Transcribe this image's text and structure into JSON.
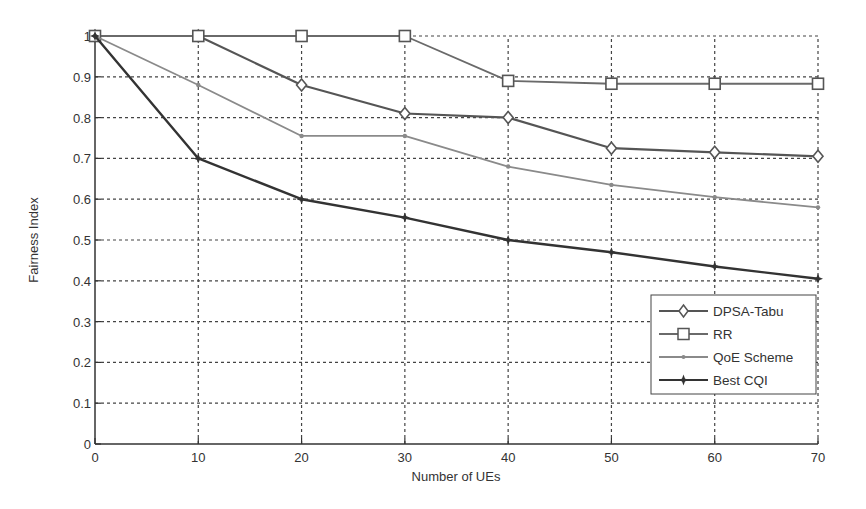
{
  "chart_data": {
    "type": "line",
    "title": "",
    "xlabel": "Number of UEs",
    "ylabel": "Fairness Index",
    "x": [
      0,
      10,
      20,
      30,
      40,
      50,
      60,
      70
    ],
    "xlim": [
      0,
      70
    ],
    "ylim": [
      0,
      1
    ],
    "xticks": [
      "0",
      "10",
      "20",
      "30",
      "40",
      "50",
      "60",
      "70"
    ],
    "yticks": [
      "0",
      "0.1",
      "0.2",
      "0.3",
      "0.4",
      "0.5",
      "0.6",
      "0.7",
      "0.8",
      "0.9",
      "1"
    ],
    "grid": true,
    "legend_position": "lower right",
    "series": [
      {
        "name": "DPSA-Tabu",
        "marker": "diamond",
        "color": "#555555",
        "width": 2.2,
        "values": [
          1.0,
          1.0,
          0.88,
          0.81,
          0.8,
          0.725,
          0.715,
          0.705
        ]
      },
      {
        "name": "RR",
        "marker": "square",
        "color": "#6a6a6a",
        "width": 1.8,
        "values": [
          1.0,
          1.0,
          1.0,
          1.0,
          0.89,
          0.883,
          0.883,
          0.883
        ]
      },
      {
        "name": "QoE Scheme",
        "marker": "dot",
        "color": "#8a8a8a",
        "width": 1.8,
        "values": [
          1.0,
          0.88,
          0.755,
          0.755,
          0.68,
          0.635,
          0.605,
          0.58
        ]
      },
      {
        "name": "Best CQI",
        "marker": "star",
        "color": "#333333",
        "width": 2.4,
        "values": [
          1.0,
          0.7,
          0.6,
          0.555,
          0.5,
          0.47,
          0.435,
          0.405
        ]
      }
    ]
  },
  "legend": {
    "items": [
      {
        "label": "DPSA-Tabu"
      },
      {
        "label": "RR"
      },
      {
        "label": "QoE Scheme"
      },
      {
        "label": "Best CQI"
      }
    ]
  },
  "axes": {
    "xlabel": "Number of UEs",
    "ylabel": "Fairness Index"
  }
}
